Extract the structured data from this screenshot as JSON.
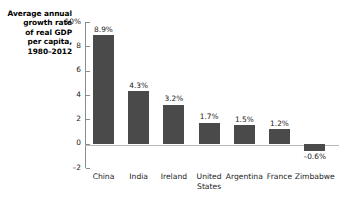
{
  "chart_data": {
    "type": "bar",
    "title": "Average annual growth rate of real GDP per capita, 1980–2012",
    "title_lines": [
      "Average annual",
      "growth rate",
      "of real GDP",
      "per capita,",
      "1980–2012"
    ],
    "xlabel": "",
    "ylabel": "Average annual growth rate of real GDP per capita, 1980–2012",
    "ylim": [
      -2,
      10
    ],
    "grid": false,
    "legend": "none",
    "y_ticks": [
      10,
      8,
      6,
      4,
      2,
      0,
      -2
    ],
    "y_tick_labels": [
      "10%",
      "8",
      "6",
      "4",
      "2",
      "0",
      "–2"
    ],
    "categories": [
      "China",
      "India",
      "Ireland",
      "United States",
      "Argentina",
      "France",
      "Zimbabwe"
    ],
    "category_label_lines": [
      [
        "China"
      ],
      [
        "India"
      ],
      [
        "Ireland"
      ],
      [
        "United",
        "States"
      ],
      [
        "Argentina"
      ],
      [
        "France"
      ],
      [
        "Zimbabwe"
      ]
    ],
    "values": [
      8.9,
      4.3,
      3.2,
      1.7,
      1.5,
      1.2,
      -0.6
    ],
    "value_labels": [
      "8.9%",
      "4.3%",
      "3.2%",
      "1.7%",
      "1.5%",
      "1.2%",
      "–0.6%"
    ],
    "bar_color": "#4a4a4a",
    "axis_color": "#8c8c8c",
    "baseline_color": "#b9b9b9",
    "background_color": "#ffffff"
  }
}
